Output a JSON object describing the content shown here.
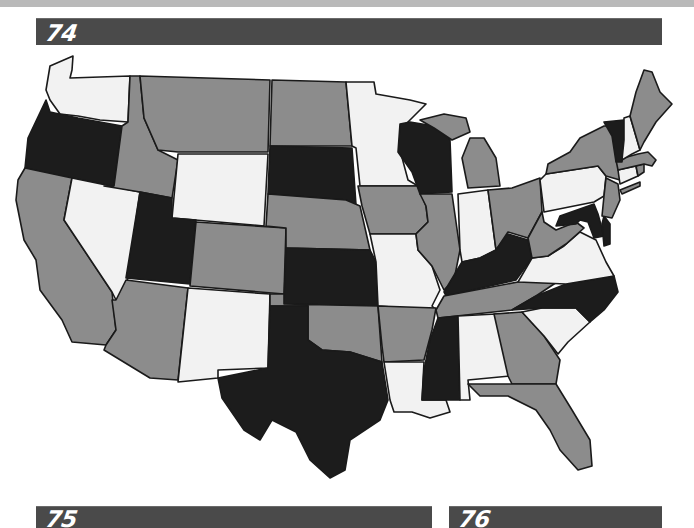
{
  "page": {
    "sections": [
      {
        "id": "74",
        "label": "74"
      },
      {
        "id": "75",
        "label": "75"
      },
      {
        "id": "76",
        "label": "76"
      }
    ]
  },
  "map": {
    "title": "United States (contiguous) - state shading",
    "legend_shades": {
      "black": "#1c1c1c",
      "gray": "#8c8c8c",
      "white": "#f2f2f2"
    },
    "states": {
      "WA": "white",
      "OR": "black",
      "CA": "gray",
      "ID": "gray",
      "NV": "white",
      "MT": "gray",
      "WY": "white",
      "UT": "black",
      "AZ": "gray",
      "CO": "gray",
      "NM": "white",
      "ND": "gray",
      "SD": "black",
      "NE": "gray",
      "KS": "black",
      "OK": "gray",
      "TX": "black",
      "MN": "white",
      "IA": "gray",
      "MO": "white",
      "AR": "gray",
      "LA": "white",
      "WI": "black",
      "IL": "gray",
      "MI": "gray",
      "IN": "white",
      "OH": "gray",
      "KY": "black",
      "TN": "gray",
      "MS": "black",
      "AL": "white",
      "GA": "gray",
      "FL": "gray",
      "SC": "white",
      "NC": "black",
      "VA": "white",
      "WV": "gray",
      "MD": "black",
      "DE": "black",
      "PA": "white",
      "NJ": "gray",
      "NY": "gray",
      "CT": "white",
      "RI": "gray",
      "MA": "gray",
      "VT": "black",
      "NH": "white",
      "ME": "gray"
    }
  }
}
